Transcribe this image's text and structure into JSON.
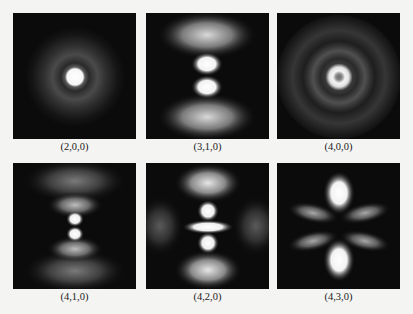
{
  "figure": {
    "panels": [
      {
        "label": "(2,0,0)",
        "n": 2,
        "l": 0,
        "m": 0,
        "description": "Central bright spot with faint surrounding ring"
      },
      {
        "label": "(3,1,0)",
        "n": 3,
        "l": 1,
        "m": 0,
        "description": "Two central lobes along vertical axis with outer diffuse lobes above and below"
      },
      {
        "label": "(4,0,0)",
        "n": 4,
        "l": 0,
        "m": 0,
        "description": "Central bright ring with concentric outer rings"
      },
      {
        "label": "(4,1,0)",
        "n": 4,
        "l": 1,
        "m": 0,
        "description": "Two small central lobes with nested arc-shaped lobes above and below"
      },
      {
        "label": "(4,2,0)",
        "n": 4,
        "l": 2,
        "m": 0,
        "description": "Central horizontal bar, lobes above and below, outer lobes at top, bottom, left, right"
      },
      {
        "label": "(4,3,0)",
        "n": 4,
        "l": 3,
        "m": 0,
        "description": "Bright lobes top and bottom, four diagonal lobes"
      }
    ],
    "colors": {
      "background": "#f4f4f2",
      "panel_background": "#0b0b0b",
      "glow": "#ffffff",
      "label_text": "#1a1a1a"
    }
  }
}
